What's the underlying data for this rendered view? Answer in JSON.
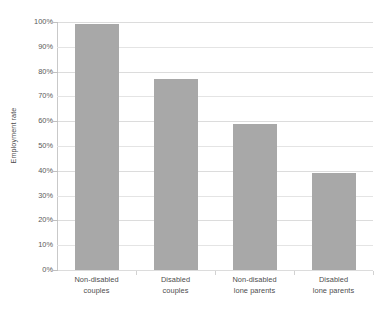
{
  "chart_data": {
    "type": "bar",
    "title": "",
    "xlabel": "",
    "ylabel": "Employment rate",
    "categories": [
      "Non-disabled couples",
      "Disabled couples",
      "Non-disabled lone parents",
      "Disabled lone parents"
    ],
    "category_lines": [
      [
        "Non-disabled",
        "couples"
      ],
      [
        "Disabled",
        "couples"
      ],
      [
        "Non-disabled",
        "lone parents"
      ],
      [
        "Disabled",
        "lone parents"
      ]
    ],
    "values": [
      99,
      77,
      59,
      39
    ],
    "value_labels": [
      "99%",
      "77%",
      "59%",
      "39%"
    ],
    "ylim": [
      0,
      100
    ],
    "ytick_values": [
      0,
      10,
      20,
      30,
      40,
      50,
      60,
      70,
      80,
      90,
      100
    ],
    "ytick_labels": [
      "0%",
      "10%",
      "20%",
      "30%",
      "40%",
      "50%",
      "60%",
      "70%",
      "80%",
      "90%",
      "100%"
    ],
    "grid": true,
    "grid_axis": "y",
    "legend": false,
    "legend_position": "none",
    "bar_color": "#a8a8a8",
    "grid_color": "#e4e4e4",
    "axis_color": "#c9c9c9",
    "text_color": "#4d4d4d"
  },
  "title_remnant": "",
  "axis": {
    "y_title": "Employment rate"
  }
}
